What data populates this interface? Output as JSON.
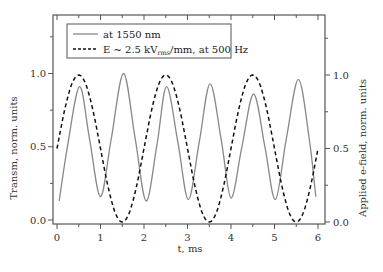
{
  "chart_data": {
    "type": "line",
    "title": "",
    "xlabel": "t, ms",
    "ylabel_left": "Transm, norm. units",
    "ylabel_right": "Applied e-field, norm. units",
    "xlim": [
      -0.05,
      6.15
    ],
    "ylim_left": [
      -0.03,
      1.4
    ],
    "ylim_right": [
      -0.01,
      1.41
    ],
    "x_ticks": [
      0,
      1,
      2,
      3,
      4,
      5,
      6
    ],
    "x_tick_labels": [
      "0",
      "1",
      "2",
      "3",
      "4",
      "5",
      "6"
    ],
    "y_ticks_left": [
      0.0,
      0.5,
      1.0
    ],
    "y_tick_labels_left": [
      "0.0",
      "0.5",
      "1.0"
    ],
    "y_ticks_right": [
      0.0,
      0.5,
      1.0
    ],
    "y_tick_labels_right": [
      "0.0",
      "0.5",
      "1.0"
    ],
    "grid": false,
    "legend_position": "upper left",
    "series": [
      {
        "name": "at 1550 nm",
        "style": "solid",
        "color": "#888888",
        "axis": "left",
        "x": [
          0.05,
          0.25,
          0.52,
          0.75,
          1.0,
          1.25,
          1.53,
          1.8,
          2.05,
          2.3,
          2.52,
          2.78,
          3.02,
          3.27,
          3.52,
          3.78,
          4.0,
          4.25,
          4.52,
          4.78,
          5.02,
          5.27,
          5.55,
          5.8,
          5.95
        ],
        "values": [
          0.13,
          0.52,
          0.91,
          0.55,
          0.16,
          0.56,
          1.0,
          0.55,
          0.13,
          0.52,
          0.91,
          0.53,
          0.14,
          0.53,
          0.93,
          0.54,
          0.15,
          0.5,
          0.86,
          0.5,
          0.14,
          0.55,
          0.96,
          0.55,
          0.16
        ]
      },
      {
        "name": "E ~ 2.5 kV_rms/mm, at 500 Hz",
        "style": "dashed",
        "color": "#111111",
        "axis": "right",
        "function": "0.5 + 0.5*sin(pi*t)",
        "x": [
          0,
          0.5,
          1.0,
          1.5,
          2.0,
          2.5,
          3.0,
          3.5,
          4.0,
          4.5,
          5.0,
          5.5,
          6.0
        ],
        "values": [
          0.5,
          1.0,
          0.5,
          0.0,
          0.5,
          1.0,
          0.5,
          0.0,
          0.5,
          1.0,
          0.5,
          0.0,
          0.5
        ]
      }
    ]
  },
  "legend": {
    "items": [
      {
        "label": "at 1550 nm",
        "style": "solid"
      },
      {
        "label_main": "E ~ 2.5 kV",
        "label_sub": "rms",
        "label_rest": "/mm, at 500 Hz",
        "style": "dashed"
      }
    ]
  },
  "colors": {
    "frame": "#555555",
    "transmission": "#888888",
    "efield": "#111111"
  }
}
